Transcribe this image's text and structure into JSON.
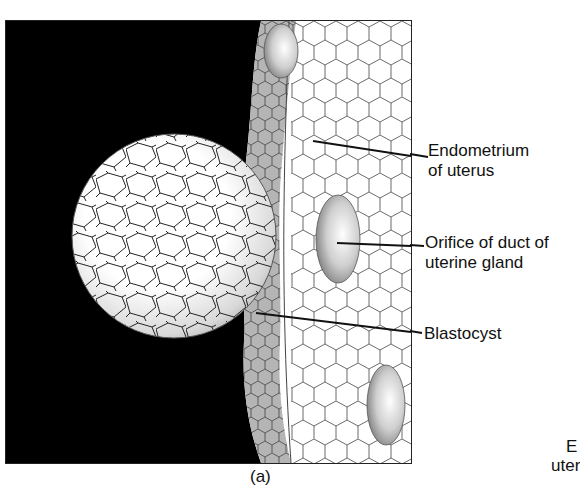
{
  "figure": {
    "caption": "(a)",
    "labels": [
      {
        "id": "endometrium",
        "line1": "Endometrium",
        "line2": "of uterus"
      },
      {
        "id": "orifice",
        "line1": "Orifice of duct of",
        "line2": "uterine gland"
      },
      {
        "id": "blastocyst",
        "line1": "Blastocyst"
      }
    ],
    "cutoff_text": {
      "line1": "E",
      "line2": "uter"
    }
  },
  "colors": {
    "background": "#000000",
    "cell_fill": "#ffffff",
    "cell_line": "#333333",
    "shade": "#9a9a9a"
  }
}
